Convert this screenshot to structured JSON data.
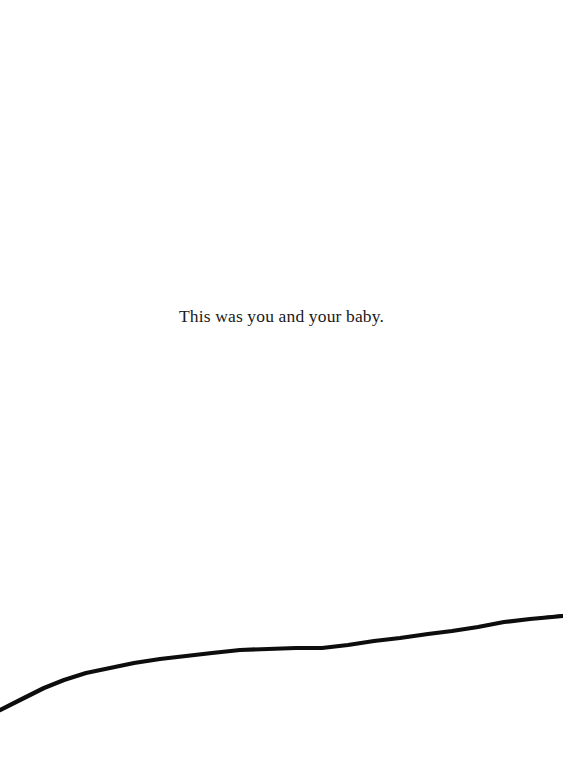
{
  "page": {
    "background_color": "#ffffff",
    "width": 563,
    "height": 768
  },
  "caption": {
    "text": "This was you and your baby.",
    "color": "#1a1a1a",
    "align": "center"
  },
  "illustration": {
    "name": "horizon-line",
    "description": "hand-drawn black ink line sloping gently upward from lower-left to right edge",
    "stroke_color": "#0d0d0d",
    "stroke_width": 4,
    "path": "M 0 710 L 22 699 L 44 688 L 64 680 L 86 673 L 110 668 L 134 663 L 160 659 L 186 656 L 212 653 L 240 650 L 268 649 L 296 648 L 322 648 L 348 645 L 374 641 L 400 638 L 428 634 L 452 631 L 478 627 L 504 622 L 530 619 L 552 617 L 563 616"
  }
}
